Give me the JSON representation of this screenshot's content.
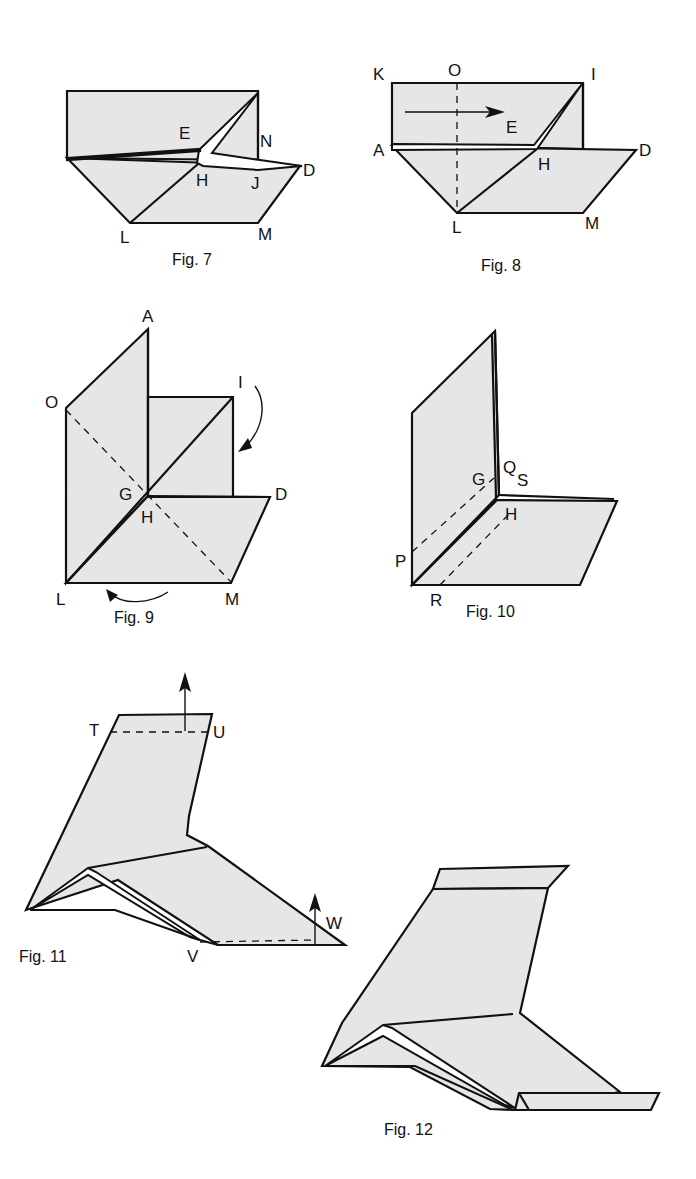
{
  "figures": [
    {
      "id": "fig7",
      "caption": "Fig. 7",
      "labels": {
        "E": "E",
        "N": "N",
        "H": "H",
        "J": "J",
        "D": "D",
        "L": "L",
        "M": "M"
      }
    },
    {
      "id": "fig8",
      "caption": "Fig. 8",
      "labels": {
        "K": "K",
        "O": "O",
        "I": "I",
        "E": "E",
        "A": "A",
        "H": "H",
        "D": "D",
        "L": "L",
        "M": "M"
      }
    },
    {
      "id": "fig9",
      "caption": "Fig. 9",
      "labels": {
        "A": "A",
        "O": "O",
        "I": "I",
        "G": "G",
        "H": "H",
        "D": "D",
        "L": "L",
        "M": "M"
      }
    },
    {
      "id": "fig10",
      "caption": "Fig. 10",
      "labels": {
        "G": "G",
        "Q": "Q",
        "S": "S",
        "H": "H",
        "P": "P",
        "R": "R"
      }
    },
    {
      "id": "fig11",
      "caption": "Fig. 11",
      "labels": {
        "T": "T",
        "U": "U",
        "V": "V",
        "W": "W"
      }
    },
    {
      "id": "fig12",
      "caption": "Fig. 12",
      "labels": {}
    }
  ],
  "colors": {
    "paper": "#e6e6e6",
    "stroke": "#111111",
    "background": "#ffffff"
  }
}
